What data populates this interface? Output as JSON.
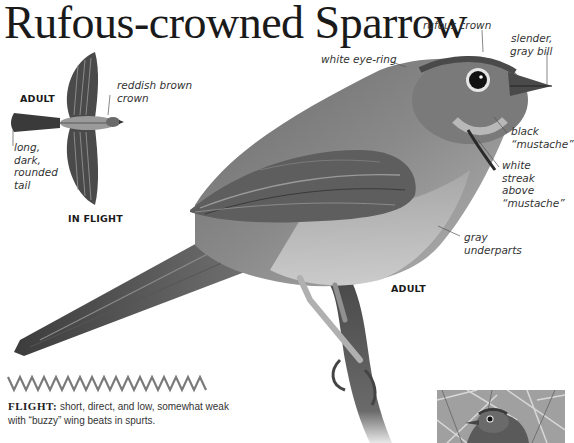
{
  "title": "Rufous-crowned Sparrow",
  "main_image": {
    "label": "ADULT",
    "callouts": {
      "rufous_crown": "rufous crown",
      "slender_bill": "slender,\ngray bill",
      "white_eye_ring": "white eye-ring",
      "black_mustache": "black\n“mustache”",
      "white_streak": "white\nstreak\nabove\n“mustache”",
      "gray_underparts": "gray\nunderparts"
    }
  },
  "flight_image": {
    "label_top": "ADULT",
    "label_bottom": "IN FLIGHT",
    "callouts": {
      "crown": "reddish brown\ncrown",
      "tail": "long,\ndark,\nrounded\ntail"
    }
  },
  "flight_pattern": {
    "icon": "zigzag-flight-path-icon",
    "color": "#7a7a7a",
    "lead": "FLIGHT:",
    "description": " short, direct, and low, somewhat weak with “buzzy” wing beats in spurts."
  },
  "thumbnail": {
    "description": "sparrow-in-brush-photo"
  }
}
